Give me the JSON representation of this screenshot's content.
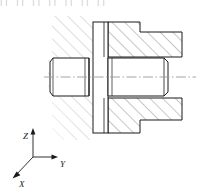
{
  "figure": {
    "background_color": "#ffffff",
    "outline_color": "#1a1a1a",
    "hatch_color_left": "#b9b9b9",
    "hatch_color_right": "#8c8c8c",
    "centerline_color": "#9a9a9a",
    "top_cropped_text": "|| || ||  || || || ||"
  },
  "axes": {
    "name": "coordinate-triad",
    "origin": {
      "x": 33,
      "y": 157
    },
    "z": {
      "label": "Z",
      "label_x": 23,
      "label_y": 136,
      "tip_x": 33,
      "tip_y": 128
    },
    "y": {
      "label": "Y",
      "label_x": 62,
      "label_y": 166,
      "tip_x": 58,
      "tip_y": 157
    },
    "x": {
      "label": "X",
      "label_x": 22,
      "label_y": 186,
      "tip_x": 13,
      "tip_y": 178
    }
  },
  "parts": {
    "left_block": {
      "name": "left-housing-broken-section",
      "hatch_angle_deg": 45,
      "hatch_spacing": 9
    },
    "plate": {
      "name": "vertical-plate",
      "x": 93,
      "y": 22,
      "width": 15,
      "height": 111,
      "hatched": false
    },
    "right_block": {
      "name": "right-housing-section",
      "hatch_angle_deg": 45,
      "hatch_spacing": 9
    },
    "left_shaft": {
      "name": "left-shaft-end",
      "chamfered": true
    },
    "right_shaft": {
      "name": "right-shaft-body",
      "chamfered": true
    },
    "centerline": {
      "name": "axis-centerline",
      "y": 77,
      "x_start": 44,
      "x_end": 196,
      "style": "dash-dot"
    }
  }
}
